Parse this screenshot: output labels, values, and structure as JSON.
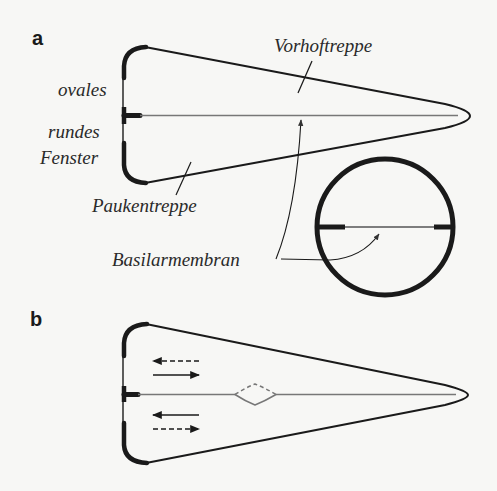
{
  "figure": {
    "panels": [
      {
        "id": "a",
        "label": "a",
        "annotations": {
          "scala_vestibuli": "Vorhoftreppe",
          "oval_window_1": "ovales",
          "round_window_1": "rundes",
          "round_window_2": "Fenster",
          "scala_tympani": "Paukentreppe",
          "basilar_membrane": "Basilarmembran"
        },
        "inset": "cross-section-circle"
      },
      {
        "id": "b",
        "label": "b",
        "arrows": [
          {
            "direction": "left",
            "style": "dashed"
          },
          {
            "direction": "right",
            "style": "solid"
          },
          {
            "direction": "left",
            "style": "solid"
          },
          {
            "direction": "right",
            "style": "dashed"
          }
        ],
        "membrane_bulge": "travelling-wave-deflection"
      }
    ],
    "colors": {
      "outline": "#1a1a1a",
      "membrane": "#777777",
      "background": "#f7f7f5"
    }
  }
}
